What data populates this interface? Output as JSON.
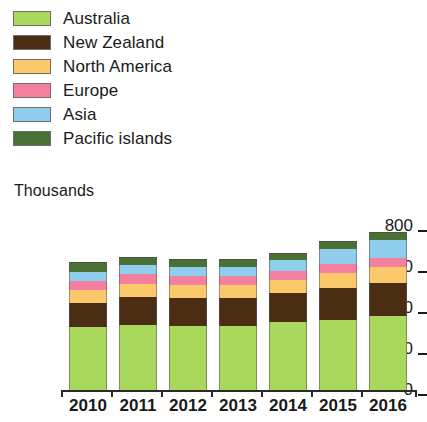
{
  "chart_data": {
    "type": "bar",
    "stacked": true,
    "title": "",
    "subtitle": "",
    "xlabel": "",
    "ylabel": "Thousands",
    "ylim": [
      0,
      800
    ],
    "yticks": [
      0,
      200,
      400,
      600,
      800
    ],
    "ytick_labels": [
      "0",
      "200",
      "400",
      "600",
      "800"
    ],
    "grid": false,
    "legend_position": "top-left",
    "categories": [
      "2010",
      "2011",
      "2012",
      "2013",
      "2014",
      "2015",
      "2016"
    ],
    "series": [
      {
        "name": "Australia",
        "color": "#a9d85c",
        "values": [
          307,
          317,
          312,
          312,
          332,
          341,
          361
        ]
      },
      {
        "name": "New Zealand",
        "color": "#4a2d12",
        "values": [
          117,
          137,
          137,
          137,
          142,
          156,
          161
        ]
      },
      {
        "name": "North America",
        "color": "#fbc96a",
        "values": [
          63,
          63,
          63,
          63,
          63,
          73,
          78
        ]
      },
      {
        "name": "Europe",
        "color": "#f4809f",
        "values": [
          44,
          49,
          44,
          44,
          44,
          44,
          44
        ]
      },
      {
        "name": "Asia",
        "color": "#8ecdeb",
        "values": [
          44,
          44,
          44,
          44,
          54,
          73,
          88
        ]
      },
      {
        "name": "Pacific islands",
        "color": "#4a7036",
        "values": [
          49,
          39,
          39,
          39,
          34,
          39,
          39
        ]
      }
    ],
    "totals": [
      624,
      649,
      639,
      639,
      669,
      726,
      771
    ]
  },
  "legend": {
    "items": [
      {
        "label": "Australia",
        "color": "#a9d85c"
      },
      {
        "label": "New Zealand",
        "color": "#4a2d12"
      },
      {
        "label": "North America",
        "color": "#fbc96a"
      },
      {
        "label": "Europe",
        "color": "#f4809f"
      },
      {
        "label": "Asia",
        "color": "#8ecdeb"
      },
      {
        "label": "Pacific islands",
        "color": "#4a7036"
      }
    ]
  },
  "axis": {
    "y_title": "Thousands"
  }
}
